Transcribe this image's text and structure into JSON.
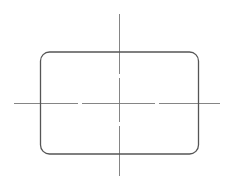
{
  "drawing": {
    "background": "#ffffff",
    "outline_color": "#555555",
    "centerline_color": "#777777",
    "shape": {
      "type": "rounded-rectangle",
      "x": 40.5,
      "y": 52,
      "width": 158,
      "height": 102,
      "corner_radius": 9,
      "stroke_width": 1.3
    },
    "centerlines": {
      "horizontal": {
        "x1": 14,
        "x2": 220,
        "y": 103,
        "gaps_x": [
          80,
          157
        ]
      },
      "vertical": {
        "x": 119.5,
        "y1": 14,
        "y2": 176,
        "gaps_y": [
          76,
          124
        ]
      }
    }
  }
}
